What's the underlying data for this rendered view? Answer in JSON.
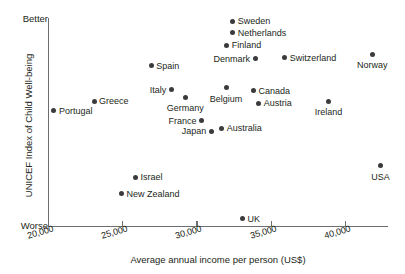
{
  "chart_data": {
    "type": "scatter",
    "title": "",
    "xlabel": "Average annual income per person (US$)",
    "ylabel": "UNICEF Index of Child Well-being",
    "grid": false,
    "legend": null,
    "xlim": [
      20000,
      42500
    ],
    "ylim": [
      0,
      1
    ],
    "x_ticks": [
      "20,000",
      "25,000",
      "30,000",
      "35,000",
      "40,000"
    ],
    "x_tick_values": [
      20000,
      25000,
      30000,
      35000,
      40000
    ],
    "y_axis_endpoints": {
      "top": "Better",
      "bottom": "Worse"
    },
    "points": [
      {
        "label": "Portugal",
        "x": 20400,
        "y": 0.555,
        "label_pos": "right"
      },
      {
        "label": "Greece",
        "x": 23100,
        "y": 0.6,
        "label_pos": "right"
      },
      {
        "label": "Spain",
        "x": 26950,
        "y": 0.77,
        "label_pos": "right"
      },
      {
        "label": "Italy",
        "x": 28300,
        "y": 0.655,
        "label_pos": "left"
      },
      {
        "label": "Germany",
        "x": 29250,
        "y": 0.62,
        "label_pos": "below"
      },
      {
        "label": "France",
        "x": 30350,
        "y": 0.505,
        "label_pos": "left"
      },
      {
        "label": "Japan",
        "x": 31000,
        "y": 0.455,
        "label_pos": "left"
      },
      {
        "label": "Australia",
        "x": 31700,
        "y": 0.47,
        "label_pos": "right"
      },
      {
        "label": "Belgium",
        "x": 32000,
        "y": 0.665,
        "label_pos": "below"
      },
      {
        "label": "Sweden",
        "x": 32450,
        "y": 0.985,
        "label_pos": "right"
      },
      {
        "label": "Netherlands",
        "x": 32450,
        "y": 0.93,
        "label_pos": "right"
      },
      {
        "label": "Finland",
        "x": 32050,
        "y": 0.87,
        "label_pos": "right"
      },
      {
        "label": "Denmark",
        "x": 33950,
        "y": 0.805,
        "label_pos": "left"
      },
      {
        "label": "UK",
        "x": 33100,
        "y": 0.035,
        "label_pos": "right"
      },
      {
        "label": "Canada",
        "x": 33850,
        "y": 0.65,
        "label_pos": "right"
      },
      {
        "label": "Austria",
        "x": 34200,
        "y": 0.59,
        "label_pos": "right"
      },
      {
        "label": "Switzerland",
        "x": 35950,
        "y": 0.81,
        "label_pos": "right"
      },
      {
        "label": "Ireland",
        "x": 38900,
        "y": 0.6,
        "label_pos": "below"
      },
      {
        "label": "Norway",
        "x": 41850,
        "y": 0.825,
        "label_pos": "below"
      },
      {
        "label": "USA",
        "x": 42400,
        "y": 0.29,
        "label_pos": "below"
      },
      {
        "label": "Israel",
        "x": 25900,
        "y": 0.235,
        "label_pos": "right"
      },
      {
        "label": "New Zealand",
        "x": 24950,
        "y": 0.155,
        "label_pos": "right"
      }
    ]
  }
}
